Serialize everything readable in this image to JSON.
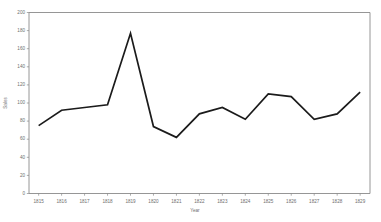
{
  "chart_data": {
    "type": "line",
    "title": "",
    "xlabel": "Year",
    "ylabel": "Sales",
    "categories": [
      "1815",
      "1816",
      "1817",
      "1818",
      "1819",
      "1820",
      "1821",
      "1822",
      "1823",
      "1824",
      "1825",
      "1826",
      "1827",
      "1828",
      "1829"
    ],
    "values": [
      75,
      92,
      95,
      98,
      177,
      74,
      62,
      88,
      95,
      82,
      110,
      107,
      82,
      88,
      112
    ],
    "series": [
      {
        "name": "Sales",
        "values": [
          75,
          92,
          95,
          98,
          177,
          74,
          62,
          88,
          95,
          82,
          110,
          107,
          82,
          88,
          112
        ]
      }
    ],
    "ylim": [
      0,
      200
    ],
    "ytick_labels": [
      "0",
      "20",
      "40",
      "60",
      "80",
      "100",
      "120",
      "140",
      "160",
      "180",
      "200"
    ],
    "ytick_values": [
      0,
      20,
      40,
      60,
      80,
      100,
      120,
      140,
      160,
      180,
      200
    ],
    "grid": false,
    "legend": false,
    "legend_position": "none",
    "line_color": "#1b1b1b",
    "axis_color": "#8a8a8a",
    "label_color": "#6e6e6e",
    "background_color": "#ffffff"
  }
}
